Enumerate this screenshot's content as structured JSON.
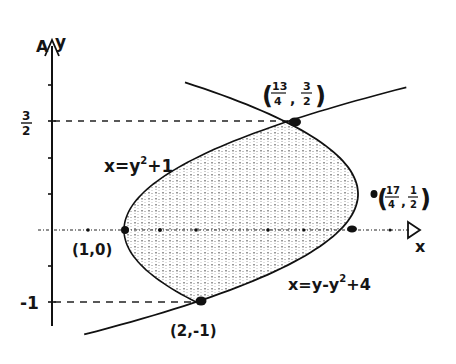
{
  "diagram": {
    "type": "region-between-curves",
    "axes": {
      "x_label": "x",
      "y_label": "y",
      "y_tick_labels": [
        {
          "value": 1.5,
          "text_num": "3",
          "text_den": "2"
        },
        {
          "value": -1,
          "text": "-1"
        }
      ]
    },
    "curves": [
      {
        "id": "left",
        "equation_label": "x=y²+1",
        "lhs": "x=",
        "base": "y",
        "exp": "2",
        "tail": "+1"
      },
      {
        "id": "right",
        "equation_label": "x=y-y²+4",
        "lhs": "x=",
        "pre": "y-",
        "base": "y",
        "exp": "2",
        "tail": "+4"
      }
    ],
    "points": [
      {
        "label": "(1,0)",
        "x": 1,
        "y": 0
      },
      {
        "label": "(2,-1)",
        "x": 2,
        "y": -1
      },
      {
        "label": "(13/4, 3/2)",
        "x": 3.25,
        "y": 1.5,
        "num_x": "13",
        "den_x": "4",
        "num_y": "3",
        "den_y": "2"
      },
      {
        "label": "(17/4, 1/2)",
        "x": 4.25,
        "y": 0.5,
        "num_x": "17",
        "den_x": "4",
        "num_y": "1",
        "den_y": "2"
      }
    ],
    "shaded_region": {
      "y_from": -1,
      "y_to": 1.5,
      "between": [
        "x=y²+1",
        "x=y-y²+4"
      ]
    },
    "dashed_guides": [
      {
        "from": "y-axis",
        "to": "(13/4, 3/2)",
        "at_y": 1.5
      },
      {
        "from": "y-axis",
        "to": "(2,-1)",
        "at_y": -1
      }
    ]
  }
}
